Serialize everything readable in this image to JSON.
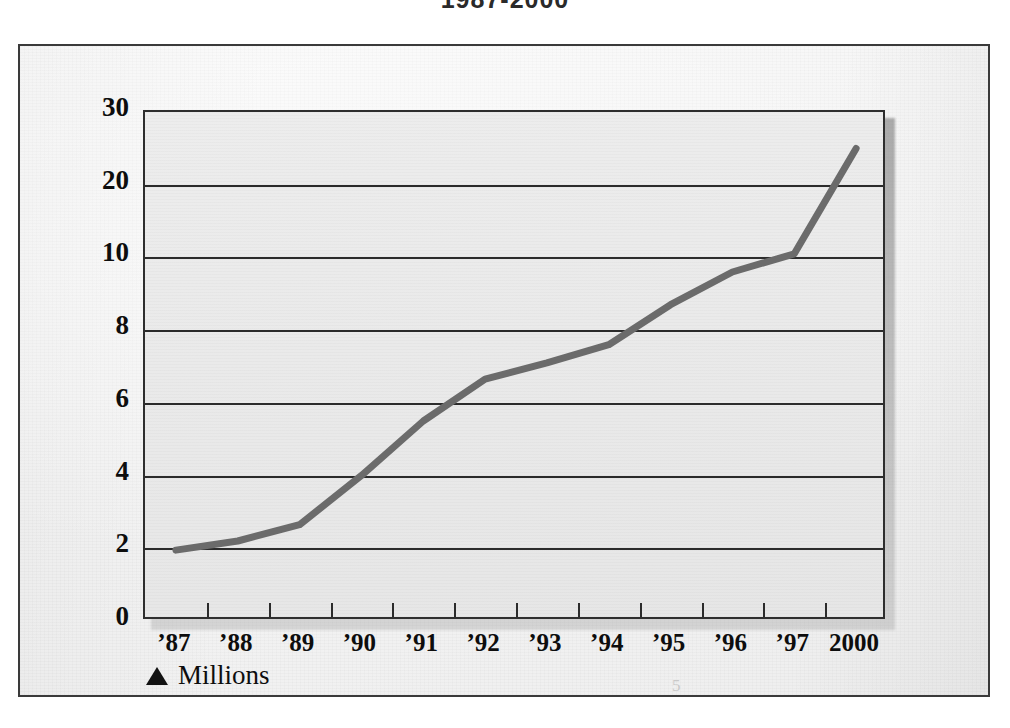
{
  "title": "1987-2000",
  "legend": {
    "marker": "triangle-up-marker",
    "label": "Millions"
  },
  "scan_artifact": "5",
  "axes": {
    "y_ticks": [
      "30",
      "20",
      "10",
      "8",
      "6",
      "4",
      "2",
      "0"
    ],
    "x_ticks": [
      "'87",
      "'88",
      "'89",
      "'90",
      "'91",
      "'92",
      "'93",
      "'94",
      "'95",
      "'96",
      "'97",
      "2000"
    ]
  },
  "colors": {
    "line": "#6b6b6b",
    "axis": "#2b2b2b",
    "plot_background": "#eaeaea",
    "page_background": "#f5f5f5",
    "text": "#0d0d0d"
  },
  "chart_data": {
    "type": "line",
    "title": "1987-2000",
    "xlabel": "",
    "ylabel": "Millions",
    "legend_position": "bottom-left",
    "grid": true,
    "y_scale": "broken-nonlinear",
    "y_tick_values": [
      30,
      20,
      10,
      8,
      6,
      4,
      2,
      0
    ],
    "ylim": [
      0,
      30
    ],
    "categories": [
      "'87",
      "'88",
      "'89",
      "'90",
      "'91",
      "'92",
      "'93",
      "'94",
      "'95",
      "'96",
      "'97",
      "2000"
    ],
    "series": [
      {
        "name": "Millions",
        "values": [
          1.95,
          2.2,
          2.65,
          4.0,
          5.5,
          6.65,
          7.1,
          7.6,
          8.7,
          9.6,
          10.5,
          25.0
        ]
      }
    ],
    "annotations": [
      "Y axis uses a compressed non-linear scale: equal spacing between 0, 2, 4, 6, 8, 10, 20, 30",
      "Steep acceleration after '97 toward 2000"
    ]
  }
}
